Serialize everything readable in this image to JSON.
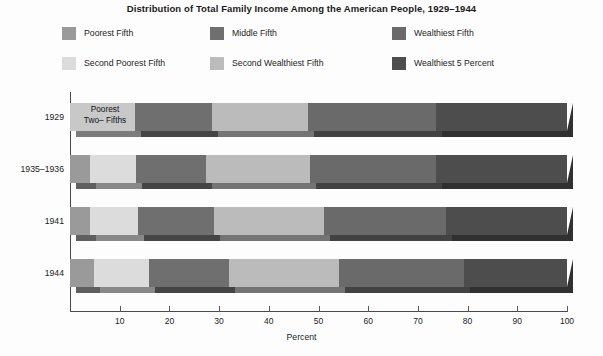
{
  "title": "Distribution of Total Family Income Among the American People, 1929–1944",
  "axis": {
    "xlabel": "Percent",
    "xticks": [
      "10",
      "20",
      "30",
      "40",
      "50",
      "60",
      "70",
      "80",
      "90",
      "100"
    ],
    "xmin": 0,
    "xmax": 100
  },
  "legend": [
    {
      "label": "Poorest Fifth",
      "color": "#9a9a9a"
    },
    {
      "label": "Middle Fifth",
      "color": "#6f6f6f"
    },
    {
      "label": "Wealthiest Fifth",
      "color": "#6a6a6a"
    },
    {
      "label": "Second Poorest Fifth",
      "color": "#dcdcdc"
    },
    {
      "label": "Second Wealthiest Fifth",
      "color": "#bbbbbb"
    },
    {
      "label": "Wealthiest 5 Percent",
      "color": "#4d4d4d"
    }
  ],
  "annotations": {
    "merged_1929": "Poorest\nTwo– Fifths"
  },
  "chart_data": {
    "type": "bar",
    "orientation": "horizontal",
    "stacked": true,
    "title": "Distribution of Total Family Income Among the American People, 1929–1944",
    "xlabel": "Percent",
    "ylabel": "",
    "xlim": [
      0,
      100
    ],
    "grid": false,
    "legend_position": "top",
    "categories": [
      "1929",
      "1935–1936",
      "1941",
      "1944"
    ],
    "series": [
      {
        "name": "Poorest Fifth",
        "color": "#9a9a9a",
        "values": [
          null,
          4.1,
          4.1,
          4.9
        ]
      },
      {
        "name": "Second Poorest Fifth",
        "color": "#dcdcdc",
        "values": [
          null,
          9.2,
          9.5,
          10.9
        ]
      },
      {
        "name": "Middle Fifth",
        "color": "#6f6f6f",
        "values": [
          15.5,
          14.1,
          15.3,
          16.2
        ]
      },
      {
        "name": "Second Wealthiest Fifth",
        "color": "#bbbbbb",
        "values": [
          19.3,
          20.9,
          22.3,
          22.2
        ]
      },
      {
        "name": "Wealthiest Fifth",
        "color": "#6a6a6a",
        "values": [
          25.7,
          25.4,
          24.5,
          25.0
        ]
      },
      {
        "name": "Wealthiest 5 Percent",
        "color": "#4d4d4d",
        "values": [
          26.4,
          26.5,
          24.0,
          20.7
        ]
      }
    ],
    "merged_series": {
      "name": "Poorest Two–Fifths",
      "color": "#c8c8c8",
      "categories": [
        "1929"
      ],
      "values": [
        13.1
      ]
    },
    "bars": [
      {
        "label": "1929",
        "segments": [
          {
            "name": "Poorest Two–Fifths",
            "start": 0.0,
            "end": 13.1,
            "value": 13.1,
            "color": "#c8c8c8",
            "label": "Poorest\nTwo– Fifths"
          },
          {
            "name": "Middle Fifth",
            "start": 13.1,
            "end": 28.6,
            "value": 15.5,
            "color": "#6f6f6f"
          },
          {
            "name": "Second Wealthiest Fifth",
            "start": 28.6,
            "end": 47.9,
            "value": 19.3,
            "color": "#bbbbbb"
          },
          {
            "name": "Wealthiest Fifth",
            "start": 47.9,
            "end": 73.6,
            "value": 25.7,
            "color": "#6a6a6a"
          },
          {
            "name": "Wealthiest 5 Percent",
            "start": 73.6,
            "end": 100.0,
            "value": 26.4,
            "color": "#4d4d4d"
          }
        ]
      },
      {
        "label": "1935–1936",
        "segments": [
          {
            "name": "Poorest Fifth",
            "start": 0.0,
            "end": 4.1,
            "value": 4.1,
            "color": "#9a9a9a"
          },
          {
            "name": "Second Poorest Fifth",
            "start": 4.1,
            "end": 13.3,
            "value": 9.2,
            "color": "#dcdcdc"
          },
          {
            "name": "Middle Fifth",
            "start": 13.3,
            "end": 27.4,
            "value": 14.1,
            "color": "#6f6f6f"
          },
          {
            "name": "Second Wealthiest Fifth",
            "start": 27.4,
            "end": 48.3,
            "value": 20.9,
            "color": "#bbbbbb"
          },
          {
            "name": "Wealthiest Fifth",
            "start": 48.3,
            "end": 73.7,
            "value": 25.4,
            "color": "#6a6a6a"
          },
          {
            "name": "Wealthiest 5 Percent",
            "start": 73.7,
            "end": 100.0,
            "value": 26.3,
            "color": "#4d4d4d"
          }
        ]
      },
      {
        "label": "1941",
        "segments": [
          {
            "name": "Poorest Fifth",
            "start": 0.0,
            "end": 4.1,
            "value": 4.1,
            "color": "#9a9a9a"
          },
          {
            "name": "Second Poorest Fifth",
            "start": 4.1,
            "end": 13.6,
            "value": 9.5,
            "color": "#dcdcdc"
          },
          {
            "name": "Middle Fifth",
            "start": 13.6,
            "end": 28.9,
            "value": 15.3,
            "color": "#6f6f6f"
          },
          {
            "name": "Second Wealthiest Fifth",
            "start": 28.9,
            "end": 51.2,
            "value": 22.3,
            "color": "#bbbbbb"
          },
          {
            "name": "Wealthiest Fifth",
            "start": 51.2,
            "end": 75.7,
            "value": 24.5,
            "color": "#6a6a6a"
          },
          {
            "name": "Wealthiest 5 Percent",
            "start": 75.7,
            "end": 100.0,
            "value": 24.3,
            "color": "#4d4d4d"
          }
        ]
      },
      {
        "label": "1944",
        "segments": [
          {
            "name": "Poorest Fifth",
            "start": 0.0,
            "end": 4.9,
            "value": 4.9,
            "color": "#9a9a9a"
          },
          {
            "name": "Second Poorest Fifth",
            "start": 4.9,
            "end": 15.8,
            "value": 10.9,
            "color": "#dcdcdc"
          },
          {
            "name": "Middle Fifth",
            "start": 15.8,
            "end": 32.0,
            "value": 16.2,
            "color": "#6f6f6f"
          },
          {
            "name": "Second Wealthiest Fifth",
            "start": 32.0,
            "end": 54.2,
            "value": 22.2,
            "color": "#bbbbbb"
          },
          {
            "name": "Wealthiest Fifth",
            "start": 54.2,
            "end": 79.2,
            "value": 25.0,
            "color": "#6a6a6a"
          },
          {
            "name": "Wealthiest 5 Percent",
            "start": 79.2,
            "end": 100.0,
            "value": 20.8,
            "color": "#4d4d4d"
          }
        ]
      }
    ]
  }
}
